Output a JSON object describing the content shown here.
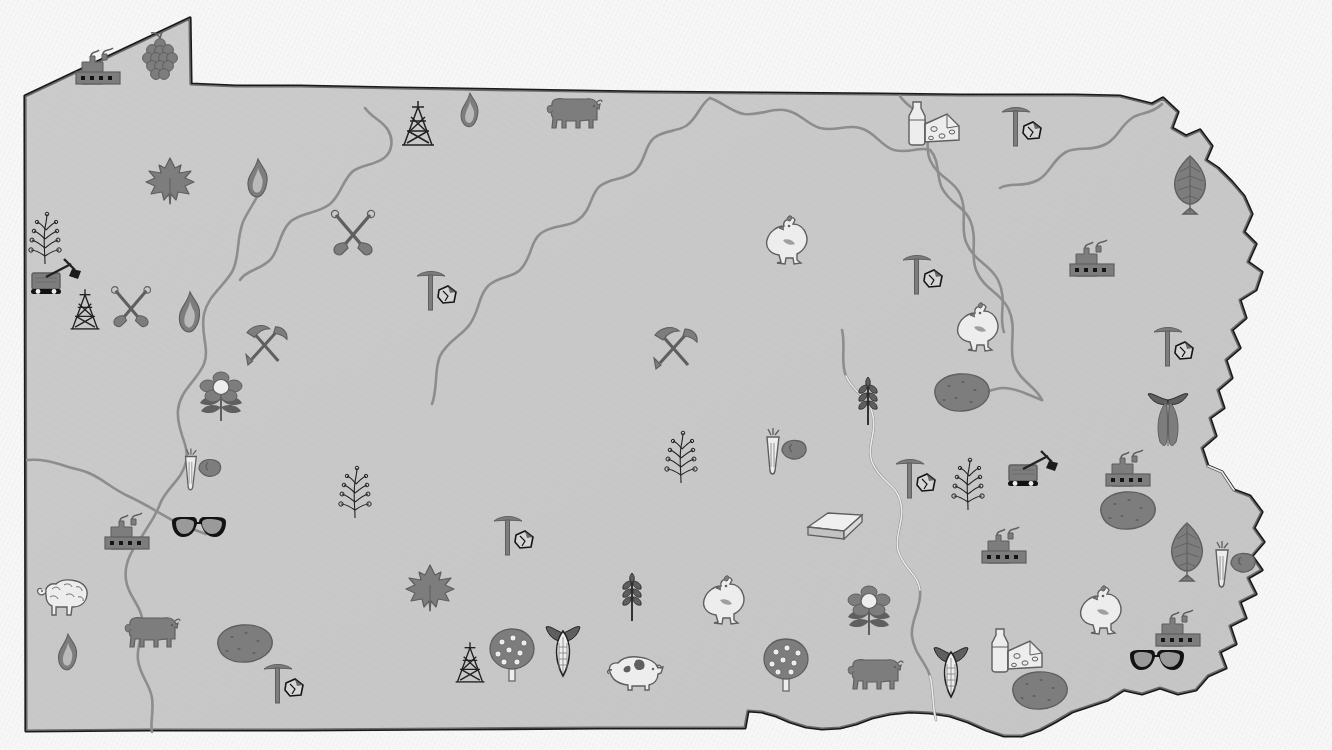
{
  "map": {
    "title": "Pennsylvania Economic Resources Pictorial Map",
    "subject": "Pennsylvania",
    "style": "grayscale pictorial resource map",
    "background_color": "#f7f7f7",
    "land_fill_color": "#c9c9c9",
    "state_outline_color": "#1a1a1a",
    "river_line_color": "#8a8a8a",
    "icon_dark_color": "#5f5f5f",
    "icon_mid_color": "#7d7d7d",
    "icon_light_color": "#ededed",
    "icon_outline_color": "#222222",
    "width": 1332,
    "height": 750
  },
  "legend_categories": [
    {
      "key": "factory",
      "label": "Manufacturing"
    },
    {
      "key": "coal-pick",
      "label": "Coal Mining"
    },
    {
      "key": "crossed-shovels",
      "label": "Mining / Quarrying"
    },
    {
      "key": "pick-shovel",
      "label": "Mining"
    },
    {
      "key": "quarry-car",
      "label": "Quarry / Stone"
    },
    {
      "key": "limestone-block",
      "label": "Limestone"
    },
    {
      "key": "oil-derrick",
      "label": "Petroleum"
    },
    {
      "key": "gas-flame",
      "label": "Natural Gas"
    },
    {
      "key": "maple-leaf",
      "label": "Maple / Hardwood"
    },
    {
      "key": "tree-leaf",
      "label": "Forestry"
    },
    {
      "key": "grapes",
      "label": "Grapes / Vineyards"
    },
    {
      "key": "apple-tree",
      "label": "Orchards / Fruit"
    },
    {
      "key": "corn",
      "label": "Corn"
    },
    {
      "key": "wheat",
      "label": "Wheat / Grain"
    },
    {
      "key": "potato",
      "label": "Potatoes"
    },
    {
      "key": "carrot-veg",
      "label": "Vegetables"
    },
    {
      "key": "mushroom-sprig",
      "label": "Nursery / Sprig Crops"
    },
    {
      "key": "flower",
      "label": "Floriculture"
    },
    {
      "key": "tobacco",
      "label": "Tobacco"
    },
    {
      "key": "cow",
      "label": "Beef Cattle"
    },
    {
      "key": "dairy",
      "label": "Dairy"
    },
    {
      "key": "chicken",
      "label": "Poultry"
    },
    {
      "key": "pig",
      "label": "Hogs"
    },
    {
      "key": "sheep",
      "label": "Sheep / Wool"
    },
    {
      "key": "eyeglasses",
      "label": "Optical / Glass Goods"
    }
  ],
  "icons": [
    {
      "id": 1,
      "type": "factory",
      "label": "Manufacturing",
      "x": 100,
      "y": 66,
      "scale": 1.0
    },
    {
      "id": 2,
      "type": "grapes",
      "label": "Grapes / Vineyards",
      "x": 160,
      "y": 56,
      "scale": 1.0
    },
    {
      "id": 3,
      "type": "maple-leaf",
      "label": "Maple / Hardwood",
      "x": 170,
      "y": 181,
      "scale": 1.0
    },
    {
      "id": 4,
      "type": "gas-flame",
      "label": "Natural Gas",
      "x": 258,
      "y": 178,
      "scale": 0.9
    },
    {
      "id": 5,
      "type": "crossed-shovels",
      "label": "Mining / Quarrying",
      "x": 353,
      "y": 233,
      "scale": 1.0
    },
    {
      "id": 6,
      "type": "oil-derrick",
      "label": "Petroleum",
      "x": 418,
      "y": 124,
      "scale": 1.0
    },
    {
      "id": 7,
      "type": "gas-flame",
      "label": "Natural Gas",
      "x": 470,
      "y": 110,
      "scale": 0.8
    },
    {
      "id": 8,
      "type": "cow",
      "label": "Beef Cattle",
      "x": 573,
      "y": 113,
      "scale": 1.0
    },
    {
      "id": 9,
      "type": "mushroom-sprig",
      "label": "Nursery / Sprig Crops",
      "x": 45,
      "y": 238,
      "scale": 1.0
    },
    {
      "id": 10,
      "type": "quarry-car",
      "label": "Quarry / Stone",
      "x": 58,
      "y": 278,
      "scale": 1.0
    },
    {
      "id": 11,
      "type": "oil-derrick",
      "label": "Petroleum",
      "x": 85,
      "y": 310,
      "scale": 0.9
    },
    {
      "id": 12,
      "type": "crossed-shovels",
      "label": "Mining / Quarrying",
      "x": 131,
      "y": 307,
      "scale": 0.9
    },
    {
      "id": 13,
      "type": "gas-flame",
      "label": "Natural Gas",
      "x": 190,
      "y": 312,
      "scale": 0.95
    },
    {
      "id": 14,
      "type": "pick-shovel",
      "label": "Mining",
      "x": 266,
      "y": 344,
      "scale": 0.95
    },
    {
      "id": 15,
      "type": "flower",
      "label": "Floriculture",
      "x": 221,
      "y": 396,
      "scale": 1.0
    },
    {
      "id": 16,
      "type": "carrot-veg",
      "label": "Vegetables",
      "x": 199,
      "y": 470,
      "scale": 0.9
    },
    {
      "id": 17,
      "type": "coal-pick",
      "label": "Coal Mining",
      "x": 437,
      "y": 290,
      "scale": 1.0
    },
    {
      "id": 18,
      "type": "pick-shovel",
      "label": "Mining",
      "x": 675,
      "y": 347,
      "scale": 1.0
    },
    {
      "id": 19,
      "type": "chicken",
      "label": "Poultry",
      "x": 786,
      "y": 240,
      "scale": 1.0
    },
    {
      "id": 20,
      "type": "chicken",
      "label": "Poultry",
      "x": 977,
      "y": 327,
      "scale": 1.0
    },
    {
      "id": 21,
      "type": "dairy",
      "label": "Dairy",
      "x": 930,
      "y": 122,
      "scale": 1.0
    },
    {
      "id": 22,
      "type": "coal-pick",
      "label": "Coal Mining",
      "x": 1022,
      "y": 126,
      "scale": 1.0
    },
    {
      "id": 23,
      "type": "coal-pick",
      "label": "Coal Mining",
      "x": 923,
      "y": 274,
      "scale": 1.0
    },
    {
      "id": 24,
      "type": "factory",
      "label": "Manufacturing",
      "x": 1094,
      "y": 258,
      "scale": 1.0
    },
    {
      "id": 25,
      "type": "tree-leaf",
      "label": "Forestry",
      "x": 1190,
      "y": 185,
      "scale": 1.0
    },
    {
      "id": 26,
      "type": "coal-pick",
      "label": "Coal Mining",
      "x": 1174,
      "y": 346,
      "scale": 1.0
    },
    {
      "id": 27,
      "type": "tobacco",
      "label": "Tobacco",
      "x": 1168,
      "y": 419,
      "scale": 1.0
    },
    {
      "id": 28,
      "type": "potato",
      "label": "Potatoes",
      "x": 960,
      "y": 392,
      "scale": 1.0
    },
    {
      "id": 29,
      "type": "wheat",
      "label": "Wheat / Grain",
      "x": 868,
      "y": 400,
      "scale": 1.0
    },
    {
      "id": 30,
      "type": "mushroom-sprig",
      "label": "Nursery / Sprig Crops",
      "x": 681,
      "y": 457,
      "scale": 1.0
    },
    {
      "id": 31,
      "type": "carrot-veg",
      "label": "Vegetables",
      "x": 782,
      "y": 452,
      "scale": 1.0
    },
    {
      "id": 32,
      "type": "limestone-block",
      "label": "Limestone",
      "x": 835,
      "y": 524,
      "scale": 1.0
    },
    {
      "id": 33,
      "type": "coal-pick",
      "label": "Coal Mining",
      "x": 916,
      "y": 478,
      "scale": 1.0
    },
    {
      "id": 34,
      "type": "mushroom-sprig",
      "label": "Nursery / Sprig Crops",
      "x": 968,
      "y": 484,
      "scale": 1.0
    },
    {
      "id": 35,
      "type": "quarry-car",
      "label": "Quarry / Stone",
      "x": 1035,
      "y": 470,
      "scale": 1.0
    },
    {
      "id": 36,
      "type": "factory",
      "label": "Manufacturing",
      "x": 1130,
      "y": 468,
      "scale": 1.0
    },
    {
      "id": 37,
      "type": "potato",
      "label": "Potatoes",
      "x": 1126,
      "y": 510,
      "scale": 1.0
    },
    {
      "id": 38,
      "type": "factory",
      "label": "Manufacturing",
      "x": 1006,
      "y": 545,
      "scale": 1.0
    },
    {
      "id": 39,
      "type": "tree-leaf",
      "label": "Forestry",
      "x": 1187,
      "y": 552,
      "scale": 1.0
    },
    {
      "id": 40,
      "type": "carrot-veg",
      "label": "Vegetables",
      "x": 1231,
      "y": 565,
      "scale": 1.0
    },
    {
      "id": 41,
      "type": "chicken",
      "label": "Poultry",
      "x": 1100,
      "y": 610,
      "scale": 1.0
    },
    {
      "id": 42,
      "type": "factory",
      "label": "Manufacturing",
      "x": 1180,
      "y": 628,
      "scale": 1.0
    },
    {
      "id": 43,
      "type": "dairy",
      "label": "Dairy",
      "x": 1013,
      "y": 649,
      "scale": 1.0
    },
    {
      "id": 44,
      "type": "eyeglasses",
      "label": "Optical / Glass Goods",
      "x": 1157,
      "y": 661,
      "scale": 1.0
    },
    {
      "id": 45,
      "type": "corn",
      "label": "Corn",
      "x": 951,
      "y": 672,
      "scale": 1.0
    },
    {
      "id": 46,
      "type": "potato",
      "label": "Potatoes",
      "x": 1038,
      "y": 690,
      "scale": 1.0
    },
    {
      "id": 47,
      "type": "flower",
      "label": "Floriculture",
      "x": 869,
      "y": 610,
      "scale": 1.0
    },
    {
      "id": 48,
      "type": "cow",
      "label": "Beef Cattle",
      "x": 874,
      "y": 674,
      "scale": 1.0
    },
    {
      "id": 49,
      "type": "apple-tree",
      "label": "Orchards / Fruit",
      "x": 786,
      "y": 664,
      "scale": 1.0
    },
    {
      "id": 50,
      "type": "chicken",
      "label": "Poultry",
      "x": 723,
      "y": 600,
      "scale": 1.0
    },
    {
      "id": 51,
      "type": "wheat",
      "label": "Wheat / Grain",
      "x": 632,
      "y": 596,
      "scale": 1.0
    },
    {
      "id": 52,
      "type": "pig",
      "label": "Hogs",
      "x": 635,
      "y": 672,
      "scale": 1.0
    },
    {
      "id": 53,
      "type": "corn",
      "label": "Corn",
      "x": 563,
      "y": 651,
      "scale": 1.0
    },
    {
      "id": 54,
      "type": "apple-tree",
      "label": "Orchards / Fruit",
      "x": 512,
      "y": 654,
      "scale": 1.0
    },
    {
      "id": 55,
      "type": "oil-derrick",
      "label": "Petroleum",
      "x": 470,
      "y": 663,
      "scale": 0.9
    },
    {
      "id": 56,
      "type": "maple-leaf",
      "label": "Maple / Hardwood",
      "x": 430,
      "y": 588,
      "scale": 1.0
    },
    {
      "id": 57,
      "type": "coal-pick",
      "label": "Coal Mining",
      "x": 514,
      "y": 535,
      "scale": 1.0
    },
    {
      "id": 58,
      "type": "mushroom-sprig",
      "label": "Nursery / Sprig Crops",
      "x": 355,
      "y": 492,
      "scale": 1.0
    },
    {
      "id": 59,
      "type": "factory",
      "label": "Manufacturing",
      "x": 129,
      "y": 531,
      "scale": 1.0
    },
    {
      "id": 60,
      "type": "eyeglasses",
      "label": "Optical / Glass Goods",
      "x": 199,
      "y": 528,
      "scale": 1.0
    },
    {
      "id": 61,
      "type": "sheep",
      "label": "Sheep / Wool",
      "x": 65,
      "y": 597,
      "scale": 1.0
    },
    {
      "id": 62,
      "type": "gas-flame",
      "label": "Natural Gas",
      "x": 68,
      "y": 652,
      "scale": 0.85
    },
    {
      "id": 63,
      "type": "cow",
      "label": "Beef Cattle",
      "x": 151,
      "y": 632,
      "scale": 1.0
    },
    {
      "id": 64,
      "type": "potato",
      "label": "Potatoes",
      "x": 243,
      "y": 643,
      "scale": 1.0
    },
    {
      "id": 65,
      "type": "coal-pick",
      "label": "Coal Mining",
      "x": 284,
      "y": 683,
      "scale": 1.0
    }
  ]
}
